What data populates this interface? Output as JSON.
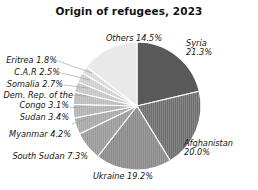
{
  "chart_data": {
    "type": "pie",
    "title": "Origin of refugees, 2023",
    "xlabel": "",
    "ylabel": "",
    "legend_position": "none",
    "grid": false,
    "units": "percent",
    "start_angle_deg": 0,
    "direction": "clockwise",
    "categories": [
      "Syria",
      "Afghanistan",
      "Ukraine",
      "South Sudan",
      "Myanmar",
      "Sudan",
      "Dem. Rep. of the Congo",
      "Somalia",
      "C.A.R",
      "Eritrea",
      "Others"
    ],
    "values": [
      21.3,
      20.0,
      19.2,
      7.3,
      4.2,
      3.4,
      3.1,
      2.7,
      2.5,
      1.8,
      14.5
    ],
    "slices": [
      {
        "name": "Syria",
        "value": 21.3,
        "label": "Syria",
        "value_label": "21.3%",
        "color": "#595959",
        "texture": "solid"
      },
      {
        "name": "Afghanistan",
        "value": 20.0,
        "label": "Afghanistan",
        "value_label": "20.0%",
        "color": "#6e6e6e",
        "texture": "hatch"
      },
      {
        "name": "Ukraine",
        "value": 19.2,
        "label": "Ukraine",
        "value_label": "19.2%",
        "color": "#8a8a8a",
        "texture": "hatch"
      },
      {
        "name": "South Sudan",
        "value": 7.3,
        "label": "South Sudan",
        "value_label": "7.3%",
        "color": "#9a9a9a",
        "texture": "hatch"
      },
      {
        "name": "Myanmar",
        "value": 4.2,
        "label": "Myanmar",
        "value_label": "4.2%",
        "color": "#a8a8a8",
        "texture": "hatch"
      },
      {
        "name": "Sudan",
        "value": 3.4,
        "label": "Sudan",
        "value_label": "3.4%",
        "color": "#b2b2b2",
        "texture": "hatch"
      },
      {
        "name": "Dem. Rep. of the Congo",
        "value": 3.1,
        "label": "Dem. Rep. of the\nCongo",
        "value_label": "3.1%",
        "color": "#bcbcbc",
        "texture": "hatch"
      },
      {
        "name": "Somalia",
        "value": 2.7,
        "label": "Somalia",
        "value_label": "2.7%",
        "color": "#c6c6c6",
        "texture": "hatch"
      },
      {
        "name": "C.A.R",
        "value": 2.5,
        "label": "C.A.R",
        "value_label": "2.5%",
        "color": "#cfcfcf",
        "texture": "hatch"
      },
      {
        "name": "Eritrea",
        "value": 1.8,
        "label": "Eritrea",
        "value_label": "1.8%",
        "color": "#d8d8d8",
        "texture": "hatch"
      },
      {
        "name": "Others",
        "value": 14.5,
        "label": "Others",
        "value_label": "14.5%",
        "color": "#e9e9e9",
        "texture": "solid"
      }
    ]
  },
  "labels": {
    "others": "Others 14.5%",
    "eritrea": "Eritrea 1.8%",
    "car": "C.A.R 2.5%",
    "somalia": "Somalia 2.7%",
    "drc_line1": "Dem. Rep. of the",
    "drc_line2": "Congo 3.1%",
    "sudan": "Sudan 3.4%",
    "myanmar": "Myanmar 4.2%",
    "south_sudan": "South Sudan 7.3%",
    "ukraine": "Ukraine 19.2%",
    "syria_line1": "Syria",
    "syria_line2": "21.3%",
    "afghanistan_line1": "Afghanistan",
    "afghanistan_line2": "20.0%"
  },
  "geometry": {
    "center_x": 137,
    "center_y": 106,
    "radius": 64
  },
  "colors": {
    "background": "#ffffff",
    "text": "#141414",
    "leader_line": "#9b9b9b",
    "slice_edge": "#ffffff"
  }
}
